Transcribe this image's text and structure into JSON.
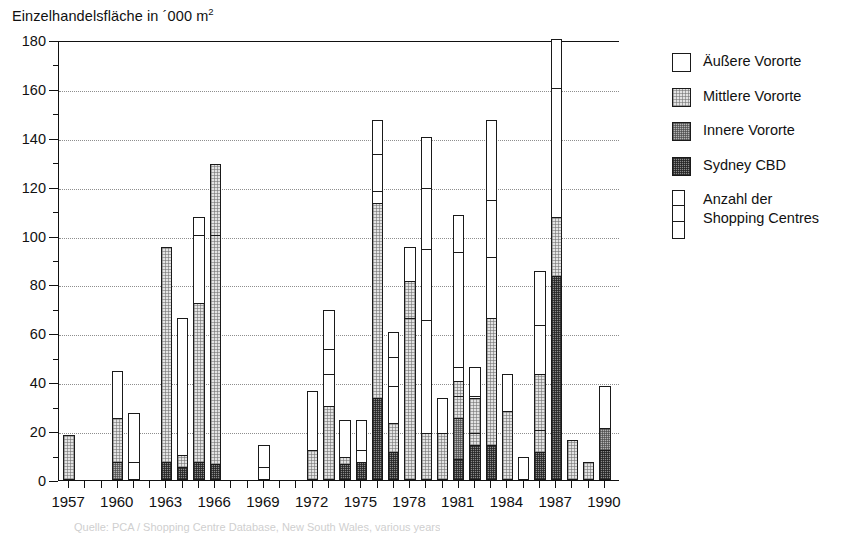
{
  "chart_data": {
    "type": "bar",
    "title_main": "Einzelhandelsfläche in ´000 m",
    "title_sup": "2",
    "xlabel": "",
    "ylabel": "",
    "ylim": [
      0,
      180
    ],
    "ytick_step": 20,
    "yminor_step": 10,
    "grid": true,
    "stacked": true,
    "legend_position": "right",
    "categories": [
      1957,
      1958,
      1959,
      1960,
      1961,
      1962,
      1963,
      1964,
      1965,
      1966,
      1967,
      1968,
      1969,
      1970,
      1971,
      1972,
      1973,
      1974,
      1975,
      1976,
      1977,
      1978,
      1979,
      1980,
      1981,
      1982,
      1983,
      1984,
      1985,
      1986,
      1987,
      1988,
      1989,
      1990
    ],
    "ytick_labels": [
      "0",
      "20",
      "40",
      "60",
      "80",
      "100",
      "120",
      "140",
      "160",
      "180"
    ],
    "xtick_labels": [
      "1957",
      "1960",
      "1963",
      "1966",
      "1969",
      "1972",
      "1975",
      "1978",
      "1981",
      "1984",
      "1987",
      "1990"
    ],
    "series": [
      {
        "name": "Sydney CBD",
        "key": "cbd",
        "swatch": "dark",
        "color": "#8a8a8a",
        "values": [
          0,
          0,
          0,
          0,
          0,
          0,
          7,
          5,
          7,
          6,
          0,
          0,
          0,
          0,
          0,
          0,
          0,
          6,
          33,
          0,
          0,
          0,
          0,
          8,
          14,
          0,
          14,
          0,
          0,
          11,
          83,
          0,
          0,
          12
        ]
      },
      {
        "name": "Innere Vororte",
        "key": "inner",
        "swatch": "medium",
        "color": "#b4b4b4",
        "values": [
          0,
          0,
          0,
          7,
          0,
          0,
          0,
          0,
          0,
          0,
          0,
          0,
          0,
          0,
          0,
          0,
          0,
          0,
          0,
          0,
          0,
          0,
          10,
          17,
          0,
          0,
          0,
          0,
          0,
          0,
          0,
          0,
          0,
          9
        ]
      },
      {
        "name": "Mittlere Vororte",
        "key": "middle",
        "swatch": "light",
        "color": "#e3e3e3",
        "values": [
          18,
          0,
          0,
          18,
          0,
          0,
          88,
          5,
          65,
          123,
          0,
          0,
          0,
          0,
          0,
          12,
          30,
          3,
          80,
          0,
          0,
          19,
          9,
          15,
          52,
          0,
          52,
          28,
          0,
          32,
          24,
          16,
          7,
          0
        ]
      },
      {
        "name": "Äußere Vororte",
        "key": "outer",
        "swatch": "white",
        "color": "#ffffff",
        "values": [
          0,
          0,
          0,
          19,
          27,
          0,
          0,
          56,
          35,
          0,
          0,
          0,
          14,
          0,
          0,
          24,
          39,
          15,
          34,
          60,
          0,
          76,
          19,
          11,
          42,
          33,
          81,
          15,
          9,
          42,
          73,
          0,
          0,
          17
        ]
      }
    ],
    "bars": [
      {
        "year": 1957,
        "total": 18,
        "cbd": 0,
        "inner": 0,
        "middle": 18,
        "outer": 0,
        "dividers": []
      },
      {
        "year": 1960,
        "total": 44,
        "cbd": 0,
        "inner": 7,
        "middle": 18,
        "outer": 19,
        "dividers": [
          25
        ]
      },
      {
        "year": 1961,
        "total": 27,
        "cbd": 0,
        "inner": 0,
        "middle": 0,
        "outer": 27,
        "dividers": [
          7
        ]
      },
      {
        "year": 1963,
        "total": 95,
        "cbd": 7,
        "inner": 0,
        "middle": 88,
        "outer": 0,
        "dividers": []
      },
      {
        "year": 1964,
        "total": 66,
        "cbd": 5,
        "inner": 0,
        "middle": 5,
        "outer": 56,
        "dividers": []
      },
      {
        "year": 1965,
        "total": 107,
        "cbd": 7,
        "inner": 0,
        "middle": 65,
        "outer": 35,
        "dividers": [
          72,
          100
        ]
      },
      {
        "year": 1966,
        "total": 130,
        "cbd": 6,
        "inner": 0,
        "middle": 123,
        "outer": 0,
        "dividers": [
          100
        ]
      },
      {
        "year": 1969,
        "total": 14,
        "cbd": 0,
        "inner": 0,
        "middle": 0,
        "outer": 14,
        "dividers": [
          5
        ]
      },
      {
        "year": 1972,
        "total": 36,
        "cbd": 0,
        "inner": 0,
        "middle": 12,
        "outer": 24,
        "dividers": []
      },
      {
        "year": 1973,
        "total": 79,
        "cbd": 0,
        "inner": 0,
        "middle": 30,
        "outer": 39,
        "dividers": [
          43,
          53
        ]
      },
      {
        "year": 1974,
        "total": 69,
        "cbd": 6,
        "inner": 0,
        "middle": 3,
        "outer": 15,
        "dividers": [
          9
        ]
      },
      {
        "year": 1975,
        "total": 24,
        "cbd": 7,
        "inner": 0,
        "middle": 0,
        "outer": 17,
        "dividers": [
          12
        ]
      },
      {
        "year": 1976,
        "total": 147,
        "cbd": 33,
        "inner": 0,
        "middle": 80,
        "outer": 34,
        "dividers": [
          113,
          118,
          133
        ]
      },
      {
        "year": 1977,
        "total": 60,
        "cbd": 11,
        "inner": 0,
        "middle": 12,
        "outer": 37,
        "dividers": [
          23,
          38,
          50
        ]
      },
      {
        "year": 1978,
        "total": 95,
        "cbd": 0,
        "inner": 0,
        "middle": 81,
        "outer": 14,
        "dividers": [
          66,
          81
        ]
      },
      {
        "year": 1979,
        "total": 140,
        "cbd": 0,
        "inner": 0,
        "middle": 19,
        "outer": 121,
        "dividers": [
          19,
          65,
          94,
          119
        ]
      },
      {
        "year": 1980,
        "total": 33,
        "cbd": 0,
        "inner": 0,
        "middle": 19,
        "outer": 14,
        "dividers": [
          19
        ]
      },
      {
        "year": 1981,
        "total": 108,
        "cbd": 8,
        "inner": 17,
        "middle": 15,
        "outer": 68,
        "dividers": [
          25,
          34,
          46,
          93
        ]
      },
      {
        "year": 1982,
        "total": 46,
        "cbd": 14,
        "inner": 0,
        "middle": 19,
        "outer": 13,
        "dividers": [
          19,
          34
        ]
      },
      {
        "year": 1983,
        "total": 147,
        "cbd": 14,
        "inner": 0,
        "middle": 52,
        "outer": 81,
        "dividers": [
          66,
          91,
          114
        ]
      },
      {
        "year": 1984,
        "total": 43,
        "cbd": 0,
        "inner": 0,
        "middle": 28,
        "outer": 15,
        "dividers": [
          28
        ]
      },
      {
        "year": 1985,
        "total": 9,
        "cbd": 0,
        "inner": 0,
        "middle": 0,
        "outer": 9,
        "dividers": []
      },
      {
        "year": 1986,
        "total": 85,
        "cbd": 11,
        "inner": 0,
        "middle": 32,
        "outer": 42,
        "dividers": [
          20,
          43,
          63
        ]
      },
      {
        "year": 1987,
        "total": 180,
        "cbd": 83,
        "inner": 0,
        "middle": 24,
        "outer": 73,
        "dividers": [
          107,
          160
        ]
      },
      {
        "year": 1988,
        "total": 16,
        "cbd": 0,
        "inner": 0,
        "middle": 16,
        "outer": 0,
        "dividers": []
      },
      {
        "year": 1989,
        "total": 7,
        "cbd": 0,
        "inner": 0,
        "middle": 7,
        "outer": 0,
        "dividers": []
      },
      {
        "year": 1990,
        "total": 38,
        "cbd": 12,
        "inner": 9,
        "middle": 0,
        "outer": 17,
        "dividers": []
      }
    ]
  },
  "legend": {
    "items": [
      {
        "label": "Äußere Vororte",
        "swatch": "white"
      },
      {
        "label": "Mittlere Vororte",
        "swatch": "light"
      },
      {
        "label": "Innere Vororte",
        "swatch": "medium"
      },
      {
        "label": "Sydney CBD",
        "swatch": "dark"
      }
    ],
    "count_label": "Anzahl der\nShopping Centres"
  },
  "source": {
    "text": "Quelle: PCA / Shopping Centre Database, New South Wales, various years"
  }
}
